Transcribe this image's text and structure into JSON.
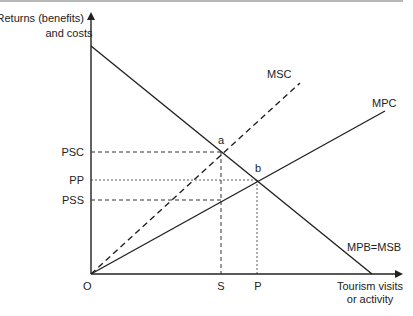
{
  "diagram": {
    "y_axis_label": [
      "Returns (benefits)",
      "and costs"
    ],
    "x_axis_label": [
      "Tourism visits",
      "or activity"
    ],
    "origin_label": "O",
    "curves": {
      "msc": "MSC",
      "mpc": "MPC",
      "mpb": "MPB=MSB"
    },
    "points": {
      "a": "a",
      "b": "b"
    },
    "y_ticks": {
      "psc": "PSC",
      "pp": "PP",
      "pss": "PSS"
    },
    "x_ticks": {
      "s": "S",
      "p": "P"
    }
  }
}
